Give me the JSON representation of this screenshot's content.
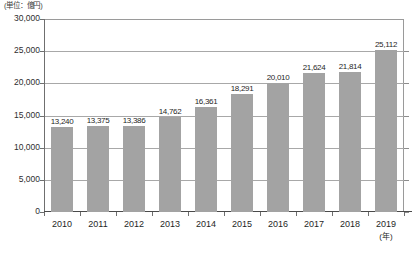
{
  "chart_data": {
    "type": "bar",
    "title": "",
    "subtitle": "",
    "unit_caption": "(単位：億円)",
    "xlabel": "(年)",
    "ylabel": "",
    "categories": [
      "2010",
      "2011",
      "2012",
      "2013",
      "2014",
      "2015",
      "2016",
      "2017",
      "2018",
      "2019"
    ],
    "values": [
      13240,
      13375,
      13386,
      14762,
      16361,
      18291,
      20010,
      21624,
      21814,
      25112
    ],
    "value_labels": [
      "13,240",
      "13,375",
      "13,386",
      "14,762",
      "16,361",
      "18,291",
      "20,010",
      "21,624",
      "21,814",
      "25,112"
    ],
    "ylim": [
      0,
      30000
    ],
    "ytick_values": [
      0,
      5000,
      10000,
      15000,
      20000,
      25000,
      30000
    ],
    "ytick_labels": [
      "0",
      "5,000",
      "10,000",
      "15,000",
      "20,000",
      "25,000",
      "30,000"
    ],
    "grid": true,
    "grid_orientation": "horizontal",
    "legend": null,
    "legend_position": "none",
    "series": [
      {
        "name": "",
        "color": "#a3a3a3",
        "values": [
          13240,
          13375,
          13386,
          14762,
          16361,
          18291,
          20010,
          21624,
          21814,
          25112
        ]
      }
    ]
  },
  "colors": {
    "bar": "#a3a3a3",
    "gridline": "#a8a8a8",
    "axis": "#6f6f6f",
    "text": "#1f1f1f",
    "background": "#ffffff"
  }
}
